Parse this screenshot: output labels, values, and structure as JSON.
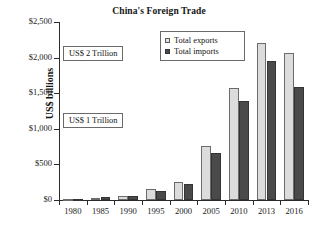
{
  "chart_data": {
    "type": "bar",
    "title": "China's Foreign Trade",
    "xlabel": "",
    "ylabel": "US$ billions",
    "categories": [
      "1980",
      "1985",
      "1990",
      "1995",
      "2000",
      "2005",
      "2010",
      "2013",
      "2016"
    ],
    "series": [
      {
        "name": "Total exports",
        "color": "#dcdcdc",
        "values": [
          18,
          27,
          62,
          149,
          249,
          762,
          1578,
          2210,
          2060
        ]
      },
      {
        "name": "Total imports",
        "color": "#4a4a4a",
        "values": [
          20,
          42,
          53,
          132,
          225,
          660,
          1396,
          1950,
          1590
        ]
      }
    ],
    "ylim": [
      0,
      2500
    ],
    "yticks": [
      0,
      500,
      1000,
      1500,
      2000,
      2500
    ],
    "ytick_labels": [
      "$0",
      "$500",
      "$1,000",
      "$1,500",
      "$2,000",
      "$2,500"
    ],
    "grid": false,
    "legend_position": "top-center",
    "annotations": [
      {
        "text": "US$ 2 Trillion",
        "value": 2000
      },
      {
        "text": "US$ 1 Trillion",
        "value": 1000
      }
    ]
  },
  "legend": {
    "items": [
      {
        "label": "Total exports"
      },
      {
        "label": "Total imports"
      }
    ]
  },
  "annotations": {
    "two_trillion": "US$ 2 Trillion",
    "one_trillion": "US$ 1 Trillion"
  }
}
